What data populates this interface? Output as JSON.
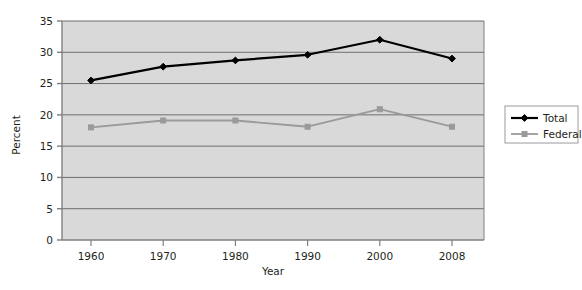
{
  "chart_data": {
    "type": "line",
    "title": "",
    "xlabel": "Year",
    "ylabel": "Percent",
    "categories": [
      "1960",
      "1970",
      "1980",
      "1990",
      "2000",
      "2008"
    ],
    "x_tick_labels": [
      "1960",
      "1970",
      "1980",
      "1990",
      "2000",
      "2008"
    ],
    "y_tick_labels": [
      "0",
      "5",
      "10",
      "15",
      "20",
      "25",
      "30",
      "35"
    ],
    "y_ticks": [
      0,
      5,
      10,
      15,
      20,
      25,
      30,
      35
    ],
    "ylim": [
      0,
      35
    ],
    "grid": "horizontal",
    "legend_position": "right",
    "plot_background": "#d9d9d9",
    "series": [
      {
        "name": "Total",
        "color": "#000000",
        "marker": "diamond",
        "values": [
          25.5,
          27.7,
          28.7,
          29.6,
          32.0,
          29.0
        ]
      },
      {
        "name": "Federal",
        "color": "#9a9a9a",
        "marker": "square",
        "values": [
          18.0,
          19.1,
          19.1,
          18.1,
          20.9,
          18.1
        ]
      }
    ]
  },
  "legend": {
    "items": [
      {
        "label": "Total",
        "color": "#000000",
        "marker": "diamond"
      },
      {
        "label": "Federal",
        "color": "#9a9a9a",
        "marker": "square"
      }
    ]
  },
  "axes": {
    "y_title": "Percent",
    "x_title": "Year"
  },
  "colors": {
    "total": "#000000",
    "federal": "#9a9a9a",
    "plot_bg": "#d9d9d9",
    "gridline": "#6e6e6e",
    "axis": "#808080",
    "text": "#231f20",
    "legend_border": "#9a9a9a",
    "page_bg": "#ffffff"
  }
}
